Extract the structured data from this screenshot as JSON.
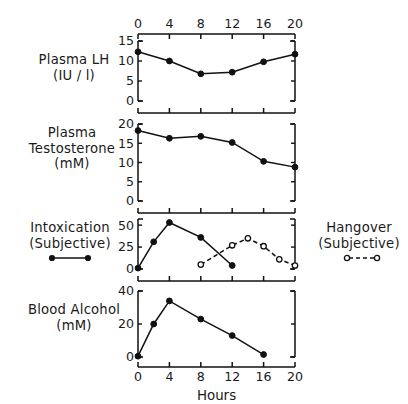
{
  "figure": {
    "xlabel": "Hours",
    "x_ticks": [
      0,
      4,
      8,
      12,
      16,
      20
    ],
    "x_tick_labels": [
      "0",
      "4",
      "8",
      "12",
      "16",
      "20"
    ],
    "xlim": [
      0,
      20
    ],
    "top_axis_ticks": [
      "0",
      "4",
      "8",
      "12",
      "16",
      "20"
    ],
    "grid": false,
    "line_color": "#111111",
    "background_color": "#ffffff"
  },
  "left_labels": [
    {
      "lines": [
        "Plasma LH",
        "(IU / l)"
      ],
      "legend": ""
    },
    {
      "lines": [
        "Plasma",
        "Testosterone",
        "(mM)"
      ],
      "legend": ""
    },
    {
      "lines": [
        "Intoxication",
        "(Subjective)"
      ],
      "legend": "filled-circle-solid-line"
    },
    {
      "lines": [
        "Blood Alcohol",
        "(mM)"
      ],
      "legend": ""
    }
  ],
  "right_labels": [
    {
      "lines": [
        "Hangover",
        "(Subjective)"
      ],
      "legend": "open-circle-dashed-line"
    }
  ],
  "legend": {
    "intoxication": {
      "label_lines": [
        "Intoxication",
        "(Subjective)"
      ],
      "marker": "filled-circle",
      "line_style": "solid"
    },
    "hangover": {
      "label_lines": [
        "Hangover",
        "(Subjective)"
      ],
      "marker": "open-circle",
      "line_style": "dashed"
    }
  },
  "chart_data": [
    {
      "type": "line",
      "panel": 1,
      "title": "Plasma LH (IU / l)",
      "ylabel": "Plasma LH (IU / l)",
      "xlabel": "Hours",
      "ylim": [
        0,
        15
      ],
      "y_ticks": [
        0,
        5,
        10,
        15
      ],
      "y_tick_labels": [
        "0",
        "5",
        "10",
        "15"
      ],
      "xlim": [
        0,
        20
      ],
      "x_ticks": [
        0,
        4,
        8,
        12,
        16,
        20
      ],
      "grid": false,
      "series": [
        {
          "name": "Plasma LH",
          "marker": "filled-circle",
          "line_style": "solid",
          "x": [
            0,
            4,
            8,
            12,
            16,
            20
          ],
          "values": [
            12.3,
            10.0,
            6.8,
            7.2,
            9.8,
            11.7
          ]
        }
      ]
    },
    {
      "type": "line",
      "panel": 2,
      "title": "Plasma Testosterone (mM)",
      "ylabel": "Plasma Testosterone (mM)",
      "xlabel": "Hours",
      "ylim": [
        0,
        20
      ],
      "y_ticks": [
        0,
        5,
        10,
        15,
        20
      ],
      "y_tick_labels": [
        "0",
        "5",
        "10",
        "15",
        "20"
      ],
      "xlim": [
        0,
        20
      ],
      "x_ticks": [
        0,
        4,
        8,
        12,
        16,
        20
      ],
      "grid": false,
      "series": [
        {
          "name": "Plasma Testosterone",
          "marker": "filled-circle",
          "line_style": "solid",
          "x": [
            0,
            4,
            8,
            12,
            16,
            20
          ],
          "values": [
            18.3,
            16.3,
            16.8,
            15.2,
            10.3,
            8.8
          ]
        }
      ]
    },
    {
      "type": "line",
      "panel": 3,
      "title": "Intoxication / Hangover (Subjective)",
      "ylabel": "Intoxication (Subjective)",
      "ylabel_right": "Hangover (Subjective)",
      "xlabel": "Hours",
      "ylim": [
        0,
        57
      ],
      "y_ticks": [
        0,
        25,
        50
      ],
      "y_tick_labels": [
        "0",
        "25",
        "50"
      ],
      "xlim": [
        0,
        20
      ],
      "x_ticks": [
        0,
        4,
        8,
        12,
        16,
        20
      ],
      "grid": false,
      "series": [
        {
          "name": "Intoxication (Subjective)",
          "marker": "filled-circle",
          "line_style": "solid",
          "x": [
            0,
            2,
            4,
            8,
            12
          ],
          "values": [
            1,
            31,
            53,
            36,
            4
          ]
        },
        {
          "name": "Hangover (Subjective)",
          "marker": "open-circle",
          "line_style": "dashed",
          "x": [
            8,
            12,
            14,
            16,
            18,
            20
          ],
          "values": [
            5,
            27,
            35,
            26,
            11,
            4
          ]
        }
      ]
    },
    {
      "type": "line",
      "panel": 4,
      "title": "Blood Alcohol (mM)",
      "ylabel": "Blood Alcohol (mM)",
      "xlabel": "Hours",
      "ylim": [
        0,
        40
      ],
      "y_ticks": [
        0,
        20,
        40
      ],
      "y_tick_labels": [
        "0",
        "20",
        "40"
      ],
      "xlim": [
        0,
        20
      ],
      "x_ticks": [
        0,
        4,
        8,
        12,
        16,
        20
      ],
      "grid": false,
      "series": [
        {
          "name": "Blood Alcohol",
          "marker": "filled-circle",
          "line_style": "solid",
          "x": [
            0,
            2,
            4,
            8,
            12,
            16
          ],
          "values": [
            0.5,
            20,
            34,
            23,
            13,
            1.5
          ]
        }
      ]
    }
  ]
}
